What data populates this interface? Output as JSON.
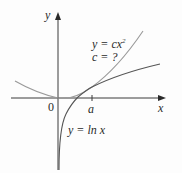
{
  "diagram": {
    "axes": {
      "x_label": "x",
      "y_label": "y",
      "origin_label": "0",
      "tick_label": "a"
    },
    "curves": [
      {
        "name": "parabola",
        "equation_lhs": "y = cx",
        "exponent": "2",
        "note": "c = ?"
      },
      {
        "name": "log",
        "equation": "y = ln x"
      }
    ],
    "colors": {
      "axis": "#3a3a3a",
      "parabola": "#9a9a9a",
      "log": "#555555",
      "text": "#2a2a2a"
    }
  }
}
